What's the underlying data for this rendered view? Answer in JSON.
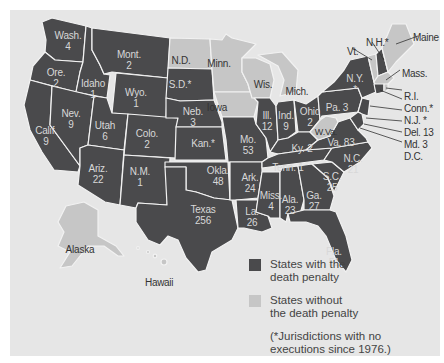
{
  "legend": {
    "with": {
      "label_line1": "States with the",
      "label_line2": "death penalty",
      "color": "#4a4a4c"
    },
    "without": {
      "label_line1": "States without",
      "label_line2": "the death penalty",
      "color": "#c6c6c6"
    },
    "note_line1": "(*Jurisdictions with no",
    "note_line2": "executions since 1976.)"
  },
  "colors": {
    "background": "#e6e6e6",
    "death_penalty": "#4a4a4c",
    "no_death_penalty": "#c6c6c6"
  },
  "states": {
    "wash": {
      "name": "Wash.",
      "count": "4"
    },
    "ore": {
      "name": "Ore.",
      "count": "2"
    },
    "calif": {
      "name": "Calif.",
      "count": "9"
    },
    "idaho": {
      "name": "Idaho",
      "count": "1"
    },
    "nev": {
      "name": "Nev.",
      "count": "9"
    },
    "mont": {
      "name": "Mont.",
      "count": "2"
    },
    "wyo": {
      "name": "Wyo.",
      "count": "1"
    },
    "utah": {
      "name": "Utah",
      "count": "6"
    },
    "colo": {
      "name": "Colo.",
      "count": "2"
    },
    "ariz": {
      "name": "Ariz.",
      "count": "22"
    },
    "nm": {
      "name": "N.M.",
      "count": "1"
    },
    "nd": {
      "name": "N.D."
    },
    "sd": {
      "name": "S.D.*"
    },
    "neb": {
      "name": "Neb.",
      "count": "3"
    },
    "kan": {
      "name": "Kan.*"
    },
    "okla": {
      "name": "Okla.",
      "count": "48"
    },
    "texas": {
      "name": "Texas",
      "count": "256"
    },
    "minn": {
      "name": "Minn."
    },
    "iowa": {
      "name": "Iowa"
    },
    "mo": {
      "name": "Mo.",
      "count": "53"
    },
    "ark": {
      "name": "Ark.",
      "count": "24"
    },
    "la": {
      "name": "La.",
      "count": "26"
    },
    "wis": {
      "name": "Wis."
    },
    "ill": {
      "name": "Ill.",
      "count": "12"
    },
    "miss": {
      "name": "Miss.",
      "count": "4"
    },
    "mich": {
      "name": "Mich."
    },
    "ind": {
      "name": "Ind.",
      "count": "9"
    },
    "ohio": {
      "name": "Ohio",
      "count": "2"
    },
    "ky": {
      "name": "Ky.",
      "count": "2"
    },
    "tenn": {
      "name": "Tenn.",
      "count": "1"
    },
    "ala": {
      "name": "Ala.",
      "count": "23"
    },
    "ga": {
      "name": "Ga.",
      "count": "27"
    },
    "fla": {
      "name": "Fla.",
      "count": "51"
    },
    "sc": {
      "name": "S.C.",
      "count": "25"
    },
    "nc": {
      "name": "N.C.",
      "count": "21"
    },
    "va": {
      "name": "Va.",
      "count": "83"
    },
    "wva": {
      "name": "W.Va."
    },
    "pa": {
      "name": "Pa.",
      "count": "3"
    },
    "ny": {
      "name": "N.Y.",
      "count": "*"
    },
    "vt": {
      "name": "Vt."
    },
    "nh": {
      "name": "N.H.*"
    },
    "maine": {
      "name": "Maine"
    },
    "mass": {
      "name": "Mass."
    },
    "ri": {
      "name": "R.I."
    },
    "conn": {
      "name": "Conn.*"
    },
    "nj": {
      "name": "N.J. *"
    },
    "del": {
      "name": "Del. 13"
    },
    "md": {
      "name": "Md. 3"
    },
    "dc": {
      "name": "D.C."
    },
    "alaska": {
      "name": "Alaska"
    },
    "hawaii": {
      "name": "Hawaii"
    }
  }
}
